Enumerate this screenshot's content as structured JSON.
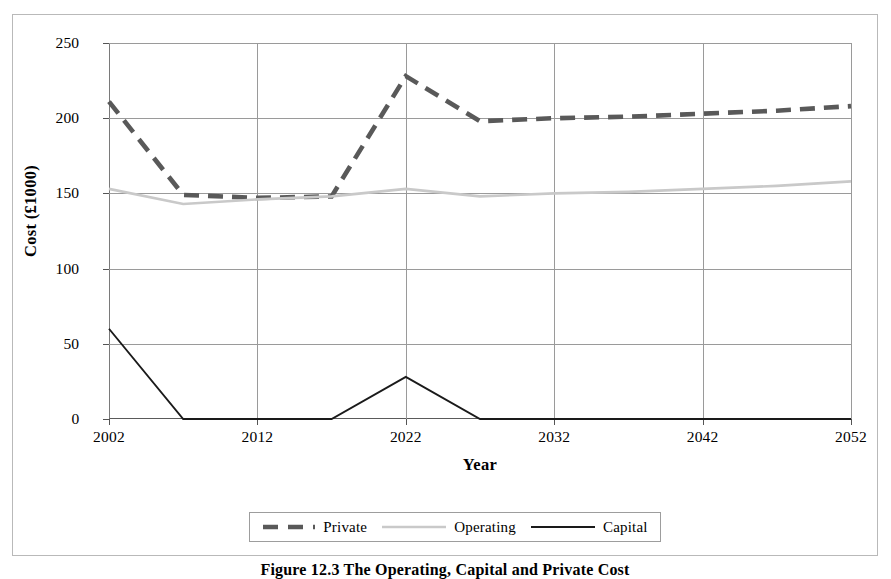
{
  "figure": {
    "caption": "Figure 12.3  The Operating, Capital and Private Cost"
  },
  "chart_data": {
    "type": "line",
    "title": "",
    "xlabel": "Year",
    "ylabel": "Cost (£1000)",
    "xlim": [
      2002,
      2052
    ],
    "ylim": [
      0,
      250
    ],
    "xticks": [
      2002,
      2012,
      2022,
      2032,
      2042,
      2052
    ],
    "yticks": [
      0,
      50,
      100,
      150,
      200,
      250
    ],
    "grid": true,
    "legend_position": "bottom",
    "series": [
      {
        "name": "Private",
        "color": "#595959",
        "style": "dashed",
        "x": [
          2002,
          2007,
          2012,
          2017,
          2022,
          2027,
          2032,
          2037,
          2042,
          2047,
          2052
        ],
        "values": [
          211,
          149,
          147,
          148,
          228,
          198,
          200,
          201,
          203,
          205,
          208
        ]
      },
      {
        "name": "Operating",
        "color": "#c9c9c9",
        "style": "solid",
        "x": [
          2002,
          2007,
          2012,
          2017,
          2022,
          2027,
          2032,
          2037,
          2042,
          2047,
          2052
        ],
        "values": [
          153,
          143,
          146,
          148,
          153,
          148,
          150,
          151,
          153,
          155,
          158
        ]
      },
      {
        "name": "Capital",
        "color": "#1a1a1a",
        "style": "solid",
        "x": [
          2002,
          2007,
          2012,
          2017,
          2022,
          2027,
          2032,
          2037,
          2042,
          2047,
          2052
        ],
        "values": [
          60,
          0,
          0,
          0,
          28,
          0,
          0,
          0,
          0,
          0,
          0
        ]
      }
    ]
  },
  "legend": {
    "items": [
      {
        "label": "Private"
      },
      {
        "label": "Operating"
      },
      {
        "label": "Capital"
      }
    ]
  }
}
